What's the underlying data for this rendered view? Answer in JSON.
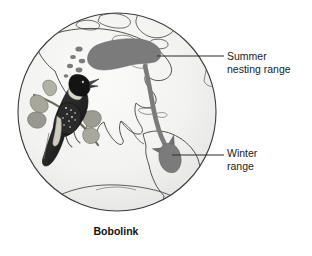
{
  "figure": {
    "caption": "Bobolink",
    "globe": {
      "name": "globe-americas",
      "center_x": 117,
      "center_y": 112,
      "radius": 100,
      "ocean_fill": "#f1f1ef",
      "outline_color": "#333333"
    },
    "ranges": [
      {
        "id": "summer",
        "name": "summer-nesting-range",
        "fill": "#7b7b7b",
        "region": "northern United States and southern Canada"
      },
      {
        "id": "winter",
        "name": "winter-range",
        "fill": "#7b7b7b",
        "region": "central South America"
      }
    ],
    "migration_arrow": {
      "name": "migration-arrow",
      "color": "#7b7b7b",
      "direction": "north to south"
    },
    "callouts": [
      {
        "id": "summer",
        "line1": "Summer",
        "line2": "nesting range",
        "leader_from_x": 157,
        "leader_from_y": 56,
        "leader_to_x": 224,
        "leader_to_y": 56
      },
      {
        "id": "winter",
        "line1": "Winter",
        "line2": "range",
        "leader_from_x": 172,
        "leader_from_y": 155,
        "leader_to_x": 224,
        "leader_to_y": 155
      }
    ],
    "bird": {
      "name": "bobolink-illustration",
      "description": "perched bobolink on a branch with leaves",
      "plumage_color": "#2b2b2b"
    }
  }
}
